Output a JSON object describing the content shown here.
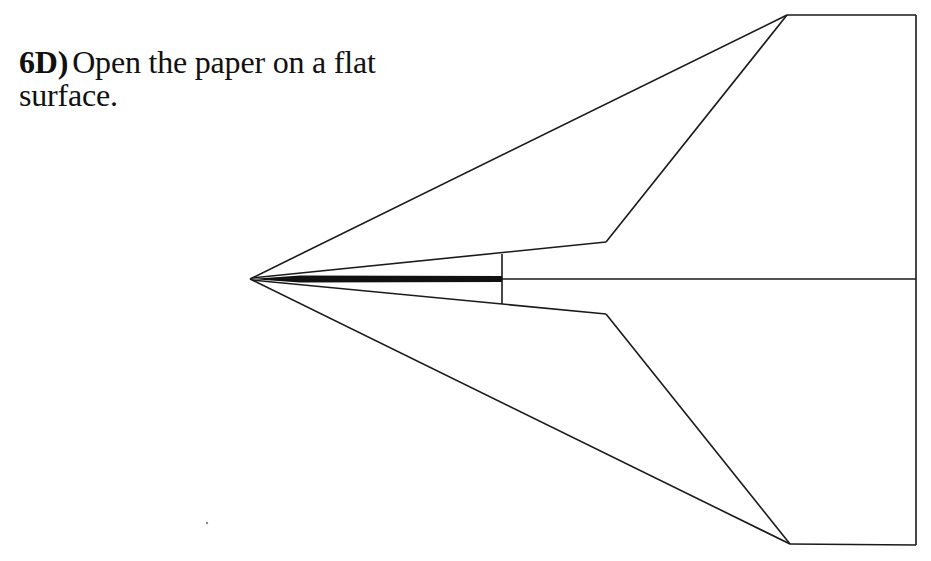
{
  "instruction": {
    "step_number": "6D)",
    "text": "Open the paper on a flat surface."
  },
  "diagram": {
    "stroke_color": "#1a1a1a",
    "background_color": "#ffffff",
    "nose": [
      250,
      279
    ],
    "outer_top_corner": [
      787,
      15
    ],
    "outer_bottom_corner": [
      790,
      544
    ],
    "right_top_corner": [
      916,
      15
    ],
    "right_bottom_corner": [
      916,
      545
    ],
    "inner_top_vertex": [
      606,
      242
    ],
    "inner_bottom_vertex": [
      606,
      314
    ],
    "crease_bar_end_x": 502,
    "crease_vertical": {
      "x": 502,
      "y_top": 254,
      "y_bottom": 304
    },
    "center_line_y": 279
  }
}
